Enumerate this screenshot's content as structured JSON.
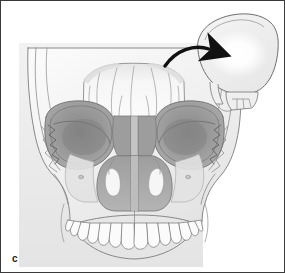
{
  "figure": {
    "panel_label": "c",
    "caption_text": "",
    "border_color": "#3a3a3a",
    "background_color": "#ffffff"
  },
  "illustration": {
    "title": "Anteroposterior skull radiographic illustration with lateral skull inset",
    "view": "anteroposterior-skull",
    "palette": {
      "plate_background": "#ededed",
      "bone_light": "#f2f2f2",
      "bone_mid": "#d8d8d8",
      "orbit_gray": "#9a9a9a",
      "orbit_shadow": "#7e7e7e",
      "sinus_gray": "#a8a8a8",
      "sinus_dark": "#8d8d8d",
      "outline": "#6e6e6e",
      "outline_dark": "#555555",
      "tooth_fill": "#fbfbfb",
      "arrow_color": "#111111",
      "glow_color": "#ffffff"
    },
    "regions": [
      {
        "name": "skull-vault-plate",
        "label": "calvarium / frontal plate"
      },
      {
        "name": "frontal-sinus",
        "label": "frontal sinus with septations"
      },
      {
        "name": "left-orbit",
        "label": "left orbital rim"
      },
      {
        "name": "right-orbit",
        "label": "right orbital rim"
      },
      {
        "name": "ethmoid-air-cells",
        "label": "ethmoid air cells"
      },
      {
        "name": "nasal-cavity",
        "label": "nasal cavity and turbinates"
      },
      {
        "name": "nasal-septum",
        "label": "nasal septum"
      },
      {
        "name": "left-maxillary-sinus",
        "label": "left maxillary sinus"
      },
      {
        "name": "right-maxillary-sinus",
        "label": "right maxillary sinus"
      },
      {
        "name": "zygomatic-arch-left",
        "label": "left zygomatic arch"
      },
      {
        "name": "zygomatic-arch-right",
        "label": "right zygomatic arch"
      },
      {
        "name": "infraorbital-foramen-left",
        "label": "left infraorbital foramen"
      },
      {
        "name": "infraorbital-foramen-right",
        "label": "right infraorbital foramen"
      },
      {
        "name": "maxillary-dental-arch",
        "label": "upper dental arch"
      },
      {
        "name": "teeth-row",
        "label": "maxillary teeth"
      },
      {
        "name": "mandible-ramus-left",
        "label": "left mandibular ramus"
      },
      {
        "name": "mandible-ramus-right",
        "label": "right mandibular ramus"
      }
    ],
    "inset": {
      "name": "lateral-skull-inset",
      "label": "lateral skull projection",
      "glow_label": "illuminated beam region",
      "arrow_label": "direction-of-beam arrow"
    },
    "teeth_count": 14
  }
}
